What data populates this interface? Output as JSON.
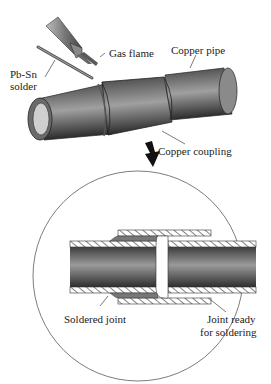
{
  "diagram": {
    "top_view": {
      "labels": {
        "gas_flame": "Gas flame",
        "copper_pipe": "Copper pipe",
        "solder_line1": "Pb-Sn",
        "solder_line2": "solder",
        "copper_coupling": "Copper coupling"
      }
    },
    "detail_view": {
      "labels": {
        "soldered_joint": "Soldered joint",
        "joint_ready_line1": "Joint ready",
        "joint_ready_line2": "for soldering"
      }
    },
    "colors": {
      "pipe_dark": "#3a3a3a",
      "pipe_mid": "#7a7a7a",
      "pipe_light": "#b5b5b5",
      "solder_fill": "#777777",
      "outline": "#222222"
    }
  }
}
